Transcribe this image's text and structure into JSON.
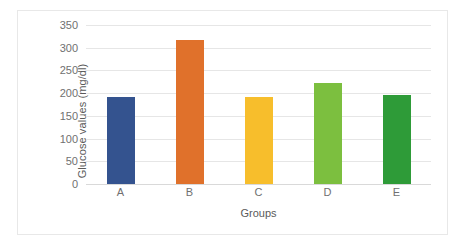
{
  "chart_data": {
    "type": "bar",
    "title": "",
    "xlabel": "Groups",
    "ylabel": "Glucose values (mg/dl)",
    "categories": [
      "A",
      "B",
      "C",
      "D",
      "E"
    ],
    "values": [
      192,
      316,
      192,
      222,
      196
    ],
    "ylim": [
      0,
      350
    ],
    "ytick_labels": [
      "0",
      "50",
      "100",
      "150",
      "200",
      "250",
      "300",
      "350"
    ],
    "ytick_values": [
      0,
      50,
      100,
      150,
      200,
      250,
      300,
      350
    ],
    "grid": true,
    "legend": "none",
    "bar_colors": [
      "#34538f",
      "#e0712b",
      "#f7be2c",
      "#7cbf3f",
      "#2e9b38"
    ],
    "gridline_color": "#e6e6e6",
    "frame_color": "#e8e8e8",
    "axis_text_color": "#707070"
  }
}
